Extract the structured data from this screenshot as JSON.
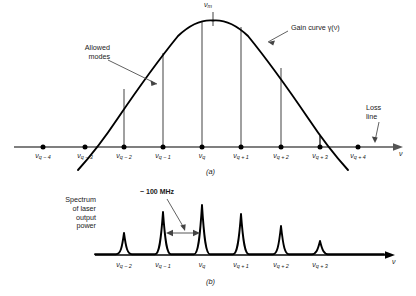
{
  "figure": {
    "domain": "scientific-diagram",
    "panel_a_caption": "(a)",
    "panel_b_caption": "(b)"
  },
  "colors": {
    "curve": "#000000",
    "axis": "#555555",
    "mode_line": "#5a5a5a",
    "peak": "#000000",
    "text": "#1a1a1a",
    "background": "#ffffff"
  },
  "panel_a": {
    "annotations": {
      "peak_label": "ν",
      "peak_sub": "m",
      "gain_curve_label": "Gain curve γ(ν)",
      "allowed_modes_line1": "Allowed",
      "allowed_modes_line2": "modes",
      "loss_line1": "Loss",
      "loss_line2": "line",
      "axis_label": "ν"
    },
    "ticks": [
      {
        "sym": "ν",
        "sub": "q − 4",
        "x": 43,
        "mode": false
      },
      {
        "sym": "ν",
        "sub": "q − 3",
        "x": 85,
        "mode": true
      },
      {
        "sym": "ν",
        "sub": "q − 2",
        "x": 124,
        "mode": true
      },
      {
        "sym": "ν",
        "sub": "q − 1",
        "x": 163,
        "mode": true
      },
      {
        "sym": "ν",
        "sub": "q",
        "x": 202,
        "mode": true
      },
      {
        "sym": "ν",
        "sub": "q + 1",
        "x": 241,
        "mode": true
      },
      {
        "sym": "ν",
        "sub": "q + 2",
        "x": 281,
        "mode": true
      },
      {
        "sym": "ν",
        "sub": "q + 3",
        "x": 320,
        "mode": true
      },
      {
        "sym": "ν",
        "sub": "q + 4",
        "x": 358,
        "mode": false
      }
    ],
    "geometry": {
      "axis_y": 147,
      "axis_x_start": 14,
      "axis_x_end": 398,
      "peak_x": 213,
      "peak_y": 21,
      "curve_left_x": 89,
      "curve_right_x": 337,
      "half_width": 124
    }
  },
  "panel_b": {
    "annotations": {
      "spectrum_line1": "Spectrum",
      "spectrum_line2": "of laser",
      "spectrum_line3": "output",
      "spectrum_line4": "power",
      "linewidth_label": "~ 100 MHz",
      "axis_label": "ν"
    },
    "ticks": [
      {
        "sym": "ν",
        "sub": "q − 2",
        "x": 124,
        "height": 22
      },
      {
        "sym": "ν",
        "sub": "q − 1",
        "x": 163,
        "height": 43
      },
      {
        "sym": "ν",
        "sub": "q",
        "x": 202,
        "height": 50
      },
      {
        "sym": "ν",
        "sub": "q + 1",
        "x": 241,
        "height": 41
      },
      {
        "sym": "ν",
        "sub": "q + 2",
        "x": 281,
        "height": 29
      },
      {
        "sym": "ν",
        "sub": "q + 3",
        "x": 320,
        "height": 14
      }
    ],
    "geometry": {
      "baseline_y": 255,
      "axis_x_start": 95,
      "axis_x_end": 392,
      "arrow_y": 233,
      "arrow_from_x": 165,
      "arrow_to_x": 200
    }
  },
  "chart_data": {
    "type": "line",
    "xlabel": "ν",
    "panels": [
      {
        "name": "(a) Gain curve and allowed modes",
        "curve": "Gain curve γ(ν)",
        "baseline": "Loss line",
        "peak_frequency": "ν_m",
        "mode_frequencies": [
          "ν_q−4",
          "ν_q−3",
          "ν_q−2",
          "ν_q−1",
          "ν_q",
          "ν_q+1",
          "ν_q+2",
          "ν_q+3",
          "ν_q+4"
        ],
        "lasing_modes": [
          "ν_q−3",
          "ν_q−2",
          "ν_q−1",
          "ν_q",
          "ν_q+1",
          "ν_q+2",
          "ν_q+3"
        ],
        "gain_above_loss": [
          0,
          2,
          58,
          94,
          126,
          120,
          79,
          11,
          0
        ]
      },
      {
        "name": "(b) Spectrum of laser output power",
        "categories": [
          "ν_q−2",
          "ν_q−1",
          "ν_q",
          "ν_q+1",
          "ν_q+2",
          "ν_q+3"
        ],
        "values": [
          22,
          43,
          50,
          41,
          29,
          14
        ],
        "annotation": "~ 100 MHz mode spacing"
      }
    ]
  }
}
